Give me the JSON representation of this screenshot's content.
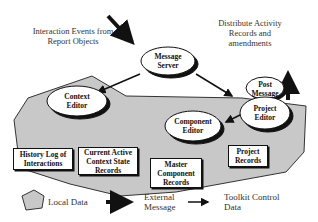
{
  "annotations": {
    "interaction_events": "Interaction Events from Report Objects",
    "distribute": "Distribute Activity Records and amendments"
  },
  "nodes": {
    "message_server": "Message Server",
    "post_message": "Post Message",
    "context_editor": "Context Editor",
    "project_editor": "Project Editor",
    "component_editor": "Component Editor"
  },
  "records": {
    "history_log": "History Log of Interactions",
    "current_active": "Current Active Context State Records",
    "master_component": "Master Component Records",
    "project_records": "Project Records"
  },
  "legend": {
    "local_data": "Local Data",
    "external_message": "External Message",
    "toolkit_control": "Toolkit Control Data"
  },
  "colors": {
    "local_data_fill": "#c8c8c8",
    "outline": "#111111"
  }
}
